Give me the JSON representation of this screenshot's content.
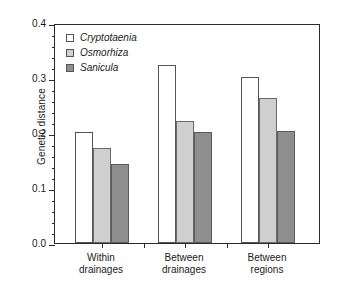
{
  "chart_data": {
    "type": "bar",
    "title": "",
    "xlabel": "",
    "ylabel": "Genetic distance",
    "categories": [
      "Within drainages",
      "Between drainages",
      "Between regions"
    ],
    "category_lines": [
      [
        "Within",
        "drainages"
      ],
      [
        "Between",
        "drainages"
      ],
      [
        "Between",
        "regions"
      ]
    ],
    "series": [
      {
        "name": "Cryptotaenia",
        "values": [
          0.202,
          0.324,
          0.302
        ],
        "color": "#ffffff",
        "edge_color": "#545454"
      },
      {
        "name": "Osmorhiza",
        "values": [
          0.173,
          0.222,
          0.264
        ],
        "color": "#cfcfcf",
        "edge_color": "#6a6a6a"
      },
      {
        "name": "Sanicula",
        "values": [
          0.144,
          0.202,
          0.204
        ],
        "color": "#8e8e8e",
        "edge_color": "#5a5a5a"
      }
    ],
    "ylim": [
      0.0,
      0.4
    ],
    "ytick_values": [
      0.0,
      0.1,
      0.2,
      0.3,
      0.4
    ],
    "ytick_labels": [
      "0.0",
      "0.1",
      "0.2",
      "0.3",
      "0.4"
    ],
    "yminor_step": 0.02,
    "grid": false,
    "legend_position": "top-left",
    "legend_italic": true,
    "frame": "full-box"
  }
}
